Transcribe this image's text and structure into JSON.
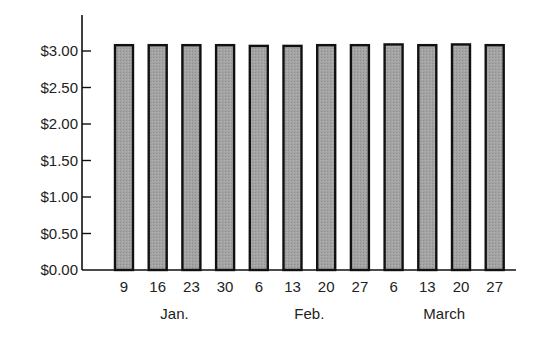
{
  "chart_data": {
    "type": "bar",
    "title": "",
    "xlabel": "",
    "ylabel": "",
    "categories": [
      "9",
      "16",
      "23",
      "30",
      "6",
      "13",
      "20",
      "27",
      "6",
      "13",
      "20",
      "27"
    ],
    "month_groups": [
      {
        "label": "Jan.",
        "category_indices": [
          0,
          1,
          2,
          3
        ]
      },
      {
        "label": "Feb.",
        "category_indices": [
          4,
          5,
          6,
          7
        ]
      },
      {
        "label": "March",
        "category_indices": [
          8,
          9,
          10,
          11
        ]
      }
    ],
    "values": [
      3.08,
      3.08,
      3.08,
      3.08,
      3.07,
      3.07,
      3.08,
      3.08,
      3.09,
      3.08,
      3.09,
      3.08
    ],
    "yticks": [
      0,
      0.5,
      1.0,
      1.5,
      2.0,
      2.5,
      3.0
    ],
    "ytick_labels": [
      "$0.00",
      "$0.50",
      "$1.00",
      "$1.50",
      "$2.00",
      "$2.50",
      "$3.00"
    ],
    "ylim": [
      0,
      3.3
    ],
    "grid": false,
    "legend": null,
    "bar_fill": "#a0a0a0",
    "bar_stroke": "#111111"
  }
}
